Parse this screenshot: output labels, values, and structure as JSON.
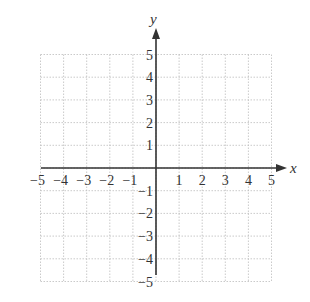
{
  "chart_data": {
    "type": "coordinate-grid",
    "title": "",
    "xlabel": "x",
    "ylabel": "y",
    "xlim": [
      -5,
      5
    ],
    "ylim": [
      -5,
      5
    ],
    "grid": true,
    "grid_style": "dotted",
    "x_ticks": [
      -5,
      -4,
      -3,
      -2,
      -1,
      1,
      2,
      3,
      4,
      5
    ],
    "y_ticks": [
      -5,
      -4,
      -3,
      -2,
      -1,
      1,
      2,
      3,
      4,
      5
    ],
    "x_tick_labels": [
      "−5",
      "−4",
      "−3",
      "−2",
      "−1",
      "1",
      "2",
      "3",
      "4",
      "5"
    ],
    "y_tick_labels": [
      "−5",
      "−4",
      "−3",
      "−2",
      "−1",
      "1",
      "2",
      "3",
      "4",
      "5"
    ],
    "series": []
  },
  "colors": {
    "axis": "#333333",
    "grid": "#bdbdbd",
    "text": "#333333"
  }
}
